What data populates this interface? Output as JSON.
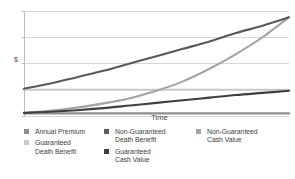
{
  "chart_data": {
    "type": "line",
    "title": "",
    "xlabel": "Time",
    "ylabel": "$",
    "xlim": [
      0,
      100
    ],
    "ylim": [
      0,
      100
    ],
    "grid": true,
    "gridlines_y": [
      0,
      25,
      50,
      75,
      100
    ],
    "legend_position": "bottom",
    "x": [
      0,
      10,
      20,
      30,
      40,
      50,
      60,
      70,
      80,
      90,
      100
    ],
    "series": [
      {
        "name": "Annual Premium",
        "color": "#8e8e8e",
        "values": [
          2.5,
          2.5,
          2.5,
          2.5,
          2.5,
          2.5,
          2.5,
          2.5,
          2.5,
          2.5,
          2.5
        ]
      },
      {
        "name": "Guaranteed Death Benefit",
        "color": "#c9c9c9",
        "values": [
          25,
          25,
          25,
          25,
          25,
          25,
          25,
          25,
          25,
          25,
          25
        ]
      },
      {
        "name": "Non-Guaranteed Death Benefit",
        "color": "#595959",
        "values": [
          26,
          31,
          37,
          43,
          50,
          57,
          64,
          71,
          79,
          86,
          94
        ]
      },
      {
        "name": "Guaranteed Cash Value",
        "color": "#3f3f3f",
        "values": [
          3,
          4,
          5.5,
          7.5,
          10,
          12.5,
          15,
          17.5,
          20,
          22,
          24
        ]
      },
      {
        "name": "Non-Guaranteed Cash Value",
        "color": "#a3a3a3",
        "values": [
          3,
          5,
          8,
          12,
          17,
          24,
          33,
          45,
          59,
          75,
          94
        ]
      }
    ]
  },
  "legend": {
    "columns": [
      {
        "items": [
          {
            "label": "Annual Premium",
            "color": "#8e8e8e"
          },
          {
            "label": "Guaranteed\nDeath Benefit",
            "color": "#c9c9c9"
          }
        ]
      },
      {
        "items": [
          {
            "label": "Non-Guaranteed\nDeath Benefit",
            "color": "#595959"
          },
          {
            "label": "Guaranteed\nCash Value",
            "color": "#3f3f3f"
          }
        ]
      },
      {
        "items": [
          {
            "label": "Non-Guaranteed\nCash Value",
            "color": "#a3a3a3"
          }
        ]
      }
    ]
  },
  "axes": {
    "y_axis_label": "$",
    "x_axis_label": "Time"
  },
  "colors": {
    "gridline": "#d6d6d6",
    "axis": "#bdbdbd",
    "text": "#3d3d3d",
    "background": "#ffffff"
  }
}
